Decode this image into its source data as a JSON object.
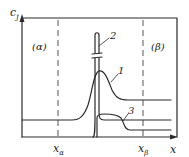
{
  "diagram": {
    "y_axis_label": "c",
    "y_axis_subscript": "j",
    "x_axis_label": "x",
    "region_left": "(α)",
    "region_right": "(β)",
    "x_markers": [
      {
        "label": "x",
        "subscript": "α"
      },
      {
        "label": "x",
        "subscript": "β"
      }
    ],
    "curve_labels": [
      "1",
      "2",
      "3"
    ]
  }
}
